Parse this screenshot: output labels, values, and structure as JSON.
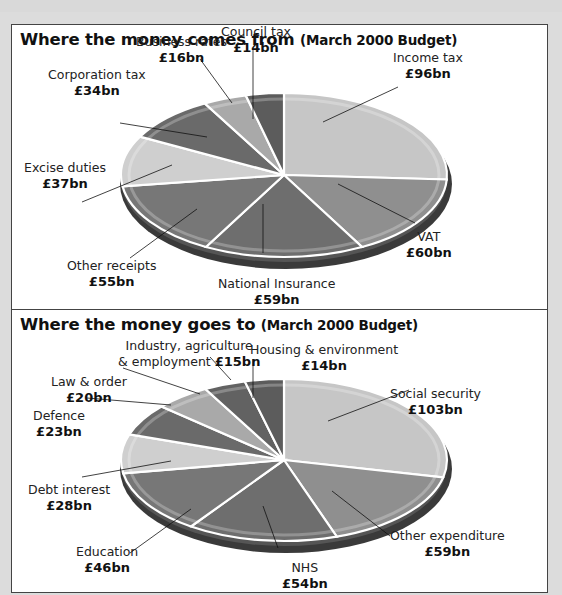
{
  "chart_data": [
    {
      "type": "pie",
      "title": "Where the money comes from",
      "subtitle": "(March 2000 Budget)",
      "unit": "£bn",
      "categories": [
        "Income tax",
        "VAT",
        "National Insurance",
        "Other receipts",
        "Excise duties",
        "Corporation tax",
        "Business rates",
        "Council tax"
      ],
      "values": [
        96,
        60,
        59,
        55,
        37,
        34,
        16,
        14
      ],
      "value_labels": [
        "£96bn",
        "£60bn",
        "£59bn",
        "£55bn",
        "£37bn",
        "£34bn",
        "£16bn",
        "£14bn"
      ],
      "colors": [
        "#c6c6c6",
        "#8f8f8f",
        "#6e6e6e",
        "#777777",
        "#cfcfcf",
        "#6a6a6a",
        "#a9a9a9",
        "#5c5c5c"
      ]
    },
    {
      "type": "pie",
      "title": "Where the money goes to",
      "subtitle": "(March 2000 Budget)",
      "unit": "£bn",
      "categories": [
        "Social security",
        "Other expenditure",
        "NHS",
        "Education",
        "Debt interest",
        "Defence",
        "Law & order",
        "Industry, agriculture & employment",
        "Housing & environment"
      ],
      "values": [
        103,
        59,
        54,
        46,
        28,
        23,
        20,
        15,
        14
      ],
      "value_labels": [
        "£103bn",
        "£59bn",
        "£54bn",
        "£46bn",
        "£28bn",
        "£23bn",
        "£20bn",
        "£15bn",
        "£14bn"
      ],
      "colors": [
        "#c6c6c6",
        "#8f8f8f",
        "#6e6e6e",
        "#777777",
        "#cfcfcf",
        "#6a6a6a",
        "#a9a9a9",
        "#626262",
        "#5c5c5c"
      ]
    }
  ],
  "panels": {
    "income": {
      "title": "Where the money comes from",
      "subtitle": "(March 2000 Budget)",
      "labels": {
        "council_tax": {
          "name": "Council tax",
          "value": "£14bn"
        },
        "business_rates": {
          "name": "Business rates",
          "value": "£16bn"
        },
        "income_tax": {
          "name": "Income tax",
          "value": "£96bn"
        },
        "corporation_tax": {
          "name": "Corporation tax",
          "value": "£34bn"
        },
        "excise_duties": {
          "name": "Excise duties",
          "value": "£37bn"
        },
        "vat": {
          "name": "VAT",
          "value": "£60bn"
        },
        "other_receipts": {
          "name": "Other receipts",
          "value": "£55bn"
        },
        "national_insurance": {
          "name": "National Insurance",
          "value": "£59bn"
        }
      }
    },
    "spending": {
      "title": "Where the money goes to",
      "subtitle": "(March 2000 Budget)",
      "labels": {
        "industry": {
          "name1": "Industry, agriculture",
          "name2": "& employment",
          "value": "£15bn"
        },
        "housing": {
          "name": "Housing & environment",
          "value": "£14bn"
        },
        "law_order": {
          "name": "Law & order",
          "value": "£20bn"
        },
        "social_security": {
          "name": "Social security",
          "value": "£103bn"
        },
        "defence": {
          "name": "Defence",
          "value": "£23bn"
        },
        "debt_interest": {
          "name": "Debt interest",
          "value": "£28bn"
        },
        "other_expenditure": {
          "name": "Other expenditure",
          "value": "£59bn"
        },
        "education": {
          "name": "Education",
          "value": "£46bn"
        },
        "nhs": {
          "name": "NHS",
          "value": "£54bn"
        }
      }
    }
  }
}
